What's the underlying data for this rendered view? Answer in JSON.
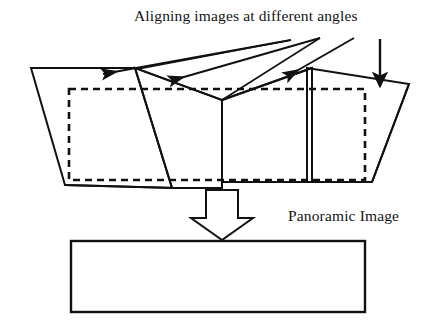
{
  "figure": {
    "title": "Aligning images at different angles",
    "output_label": "Panoramic Image",
    "stroke_color": "#111111",
    "fill_color": "#ffffff",
    "background": "#ffffff"
  },
  "diagram": {
    "type": "schematic",
    "source_images": [
      {
        "name": "source-quad-1",
        "points": "31,68 139,68 175,188 65,185"
      },
      {
        "name": "source-quad-2",
        "points": "135,68 222,100 222,188 172,188"
      },
      {
        "name": "source-quad-3",
        "points": "222,100 312,68 312,182 222,182"
      },
      {
        "name": "source-quad-4",
        "points": "307,68 409,84 372,182 307,182"
      }
    ],
    "aligned_region": {
      "name": "dashed-alignment-rectangle",
      "x": 69,
      "y": 89,
      "width": 296,
      "height": 91,
      "dash": "7,5"
    },
    "pointer_arrows": [
      {
        "name": "pointer-arrow-1",
        "from": "291,40",
        "to": "98,75"
      },
      {
        "name": "pointer-arrow-2",
        "from": "320,38",
        "to": "165,82"
      },
      {
        "name": "pointer-arrow-3",
        "from": "354,38",
        "to": "281,78"
      },
      {
        "name": "pointer-arrow-4",
        "from": "380,39",
        "to": "380,89"
      }
    ],
    "block_arrow": {
      "name": "panorama-block-arrow",
      "points": "206,190 238,190 238,218 253,218 222,240 191,218 206,218"
    },
    "output_rectangle": {
      "name": "panoramic-output-rectangle",
      "x": 71,
      "y": 241,
      "width": 294,
      "height": 71
    }
  }
}
